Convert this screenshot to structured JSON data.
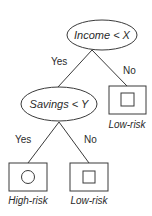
{
  "diagram": {
    "type": "decision-tree",
    "root": {
      "condition": "Income < X",
      "yes_edge": "Yes",
      "no_edge": "No"
    },
    "internal": {
      "condition": "Savings < Y",
      "yes_edge": "Yes",
      "no_edge": "No"
    },
    "leaves": [
      {
        "label": "Low-risk",
        "symbol": "square",
        "position": "root-no"
      },
      {
        "label": "High-risk",
        "symbol": "circle",
        "position": "savings-yes"
      },
      {
        "label": "Low-risk",
        "symbol": "square",
        "position": "savings-no"
      }
    ]
  },
  "colors": {
    "stroke": "#3a3a3a",
    "text": "#2b2b2b",
    "background": "#ffffff"
  }
}
